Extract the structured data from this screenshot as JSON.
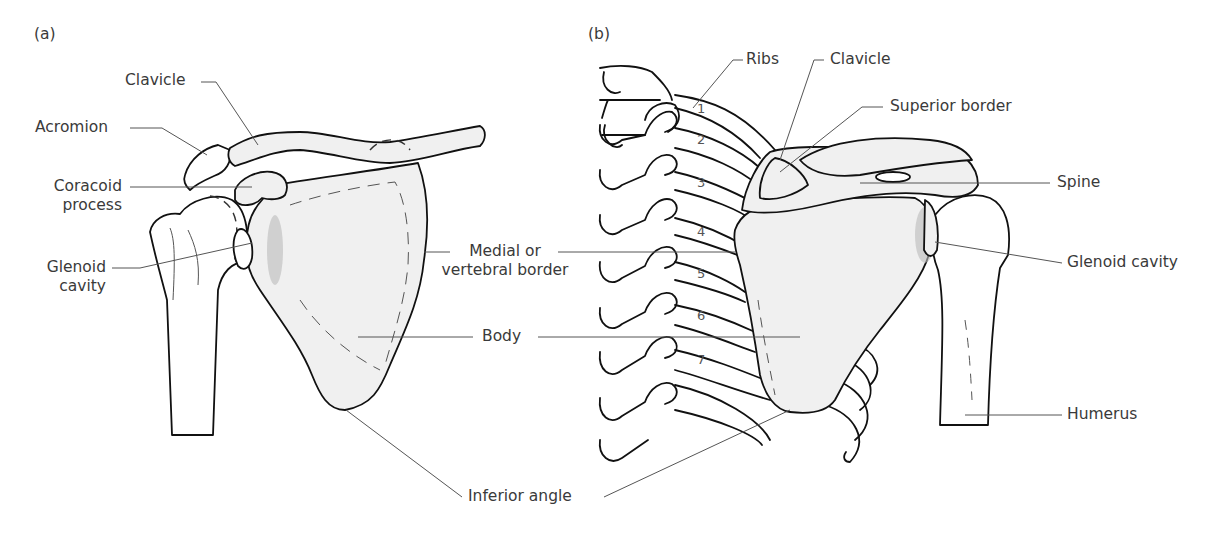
{
  "figure": {
    "panels": [
      {
        "id": "a",
        "label": "(a)",
        "view": "anterior",
        "labels": {
          "clavicle": "Clavicle",
          "acromion": "Acromion",
          "coracoid_1": "Coracoid",
          "coracoid_2": "process",
          "glenoid_1": "Glenoid",
          "glenoid_2": "cavity",
          "medial_1": "Medial or",
          "medial_2": "vertebral border",
          "body": "Body"
        }
      },
      {
        "id": "b",
        "label": "(b)",
        "view": "posterior",
        "labels": {
          "ribs": "Ribs",
          "clavicle": "Clavicle",
          "superior_border": "Superior border",
          "spine": "Spine",
          "glenoid": "Glenoid cavity",
          "humerus": "Humerus"
        },
        "rib_numbers": [
          "1",
          "2",
          "3",
          "4",
          "5",
          "6",
          "7"
        ]
      }
    ],
    "shared_labels": {
      "inferior_angle": "Inferior angle"
    },
    "colors": {
      "bone_fill": "#f0f0f0",
      "outline": "#111111",
      "leader_line": "#555555",
      "text": "#3a3a3a"
    }
  }
}
